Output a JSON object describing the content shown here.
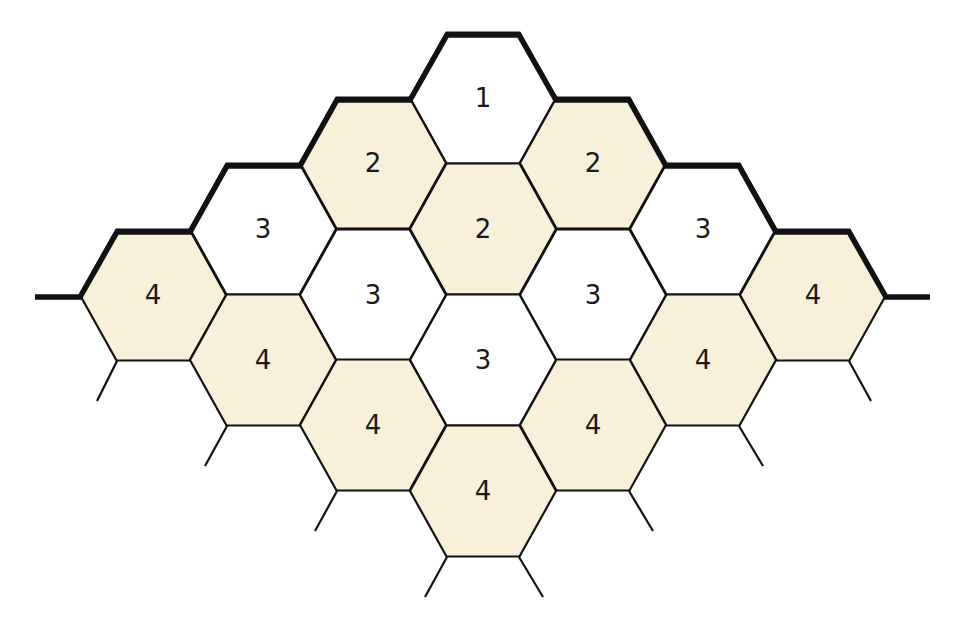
{
  "diagram": {
    "type": "hexagonal-grid",
    "colors": {
      "cream": "#f8f0d8",
      "white": "#ffffff",
      "stroke": "#111111"
    },
    "hex_radius": 73,
    "cells": [
      {
        "id": "h1",
        "cx": 483,
        "cy": 98,
        "label": "1",
        "fill": "white"
      },
      {
        "id": "h2a",
        "cx": 373,
        "cy": 163,
        "label": "2",
        "fill": "cream"
      },
      {
        "id": "h2b",
        "cx": 593,
        "cy": 163,
        "label": "2",
        "fill": "cream"
      },
      {
        "id": "h2c",
        "cx": 483,
        "cy": 229,
        "label": "2",
        "fill": "cream"
      },
      {
        "id": "h3a",
        "cx": 263,
        "cy": 229,
        "label": "3",
        "fill": "white"
      },
      {
        "id": "h3b",
        "cx": 703,
        "cy": 229,
        "label": "3",
        "fill": "white"
      },
      {
        "id": "h3c",
        "cx": 373,
        "cy": 295,
        "label": "3",
        "fill": "white"
      },
      {
        "id": "h3d",
        "cx": 593,
        "cy": 295,
        "label": "3",
        "fill": "white"
      },
      {
        "id": "h3e",
        "cx": 483,
        "cy": 360,
        "label": "3",
        "fill": "white"
      },
      {
        "id": "h4a",
        "cx": 153,
        "cy": 295,
        "label": "4",
        "fill": "cream"
      },
      {
        "id": "h4b",
        "cx": 813,
        "cy": 295,
        "label": "4",
        "fill": "cream"
      },
      {
        "id": "h4c",
        "cx": 263,
        "cy": 360,
        "label": "4",
        "fill": "cream"
      },
      {
        "id": "h4d",
        "cx": 703,
        "cy": 360,
        "label": "4",
        "fill": "cream"
      },
      {
        "id": "h4e",
        "cx": 373,
        "cy": 425,
        "label": "4",
        "fill": "cream"
      },
      {
        "id": "h4f",
        "cx": 593,
        "cy": 425,
        "label": "4",
        "fill": "cream"
      },
      {
        "id": "h4g",
        "cx": 483,
        "cy": 491,
        "label": "4",
        "fill": "cream"
      }
    ]
  }
}
